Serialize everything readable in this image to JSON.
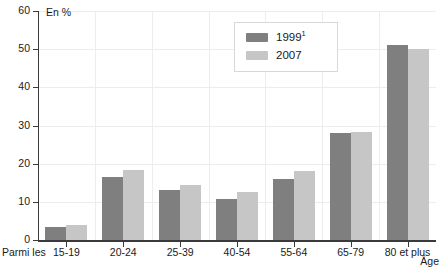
{
  "chart_data": {
    "type": "bar",
    "title": "",
    "subtitle": "",
    "unit_label": "En %",
    "xlabel": "Âge",
    "ylabel": "",
    "x_prefix_label": "Parmi les",
    "categories": [
      "15-19",
      "20-24",
      "25-39",
      "40-54",
      "55-64",
      "65-79",
      "80 et plus"
    ],
    "series": [
      {
        "name": "1999",
        "name_superscript": "1",
        "color": "#7f7f7f",
        "values": [
          3.3,
          16.6,
          13.0,
          10.8,
          16.0,
          28.0,
          51.0
        ]
      },
      {
        "name": "2007",
        "name_superscript": "",
        "color": "#c6c6c6",
        "values": [
          4.0,
          18.3,
          14.5,
          12.7,
          18.2,
          28.2,
          50.0
        ]
      }
    ],
    "ylim": [
      0,
      60
    ],
    "yticks": [
      0,
      10,
      20,
      30,
      40,
      50,
      60
    ],
    "ytick_labels": [
      "0",
      "10",
      "20",
      "30",
      "40",
      "50",
      "60"
    ],
    "grid": true,
    "grid_color": "#ececec",
    "legend_position": "top-center-right",
    "axis_color": "#3a3a3a",
    "background": "#ffffff"
  },
  "legend": {
    "entries": [
      {
        "label": "1999",
        "superscript": "1"
      },
      {
        "label": "2007",
        "superscript": ""
      }
    ]
  }
}
